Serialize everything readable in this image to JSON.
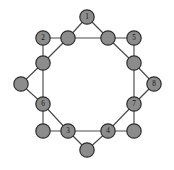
{
  "figure": {
    "name": "node-link-graph",
    "background_color": "#ffffff"
  },
  "style": {
    "node_fill": "#8c8c8c",
    "node_stroke": "#2e2e2e",
    "edge_color": "#4a4a4a",
    "label_color": "#141414",
    "node_radius": 7.2,
    "edge_width": 1.15
  },
  "chart_data": {
    "type": "diagram",
    "title": "",
    "layout": "star-of-eight-points over inner octagon",
    "node_count": 16,
    "edge_count": 24,
    "nodes": [
      {
        "id": "outer-n",
        "label": "1",
        "x": 87,
        "y": 17,
        "ring": "outer",
        "label_visible": true
      },
      {
        "id": "outer-nw",
        "label": "2",
        "x": 43,
        "y": 38,
        "ring": "outer",
        "label_visible": true
      },
      {
        "id": "outer-ne",
        "label": "5",
        "x": 134,
        "y": 38,
        "ring": "outer",
        "label_visible": true
      },
      {
        "id": "outer-w",
        "label": "",
        "x": 21,
        "y": 84,
        "ring": "outer",
        "label_visible": false
      },
      {
        "id": "outer-e",
        "label": "8",
        "x": 154,
        "y": 84,
        "ring": "outer",
        "label_visible": true
      },
      {
        "id": "outer-sw",
        "label": "",
        "x": 43,
        "y": 131,
        "ring": "outer",
        "label_visible": false
      },
      {
        "id": "outer-se",
        "label": "",
        "x": 134,
        "y": 131,
        "ring": "outer",
        "label_visible": false
      },
      {
        "id": "outer-s",
        "label": "",
        "x": 87,
        "y": 150,
        "ring": "outer",
        "label_visible": false
      },
      {
        "id": "inner-nnw",
        "label": "",
        "x": 68,
        "y": 38,
        "ring": "inner",
        "label_visible": false
      },
      {
        "id": "inner-nne",
        "label": "",
        "x": 108,
        "y": 38,
        "ring": "inner",
        "label_visible": false
      },
      {
        "id": "inner-wnw",
        "label": "",
        "x": 43,
        "y": 63,
        "ring": "inner",
        "label_visible": false
      },
      {
        "id": "inner-ene",
        "label": "",
        "x": 134,
        "y": 63,
        "ring": "inner",
        "label_visible": false
      },
      {
        "id": "inner-wsw",
        "label": "6",
        "x": 43,
        "y": 104,
        "ring": "inner",
        "label_visible": true
      },
      {
        "id": "inner-ese",
        "label": "7",
        "x": 134,
        "y": 104,
        "ring": "inner",
        "label_visible": true
      },
      {
        "id": "inner-ssw",
        "label": "3",
        "x": 68,
        "y": 131,
        "ring": "inner",
        "label_visible": true
      },
      {
        "id": "inner-sse",
        "label": "4",
        "x": 108,
        "y": 131,
        "ring": "inner",
        "label_visible": true
      }
    ],
    "edges": [
      {
        "from": "outer-n",
        "to": "inner-nnw"
      },
      {
        "from": "outer-n",
        "to": "inner-nne"
      },
      {
        "from": "outer-nw",
        "to": "inner-nnw"
      },
      {
        "from": "outer-nw",
        "to": "inner-wnw"
      },
      {
        "from": "outer-ne",
        "to": "inner-nne"
      },
      {
        "from": "outer-ne",
        "to": "inner-ene"
      },
      {
        "from": "outer-w",
        "to": "inner-wnw"
      },
      {
        "from": "outer-w",
        "to": "inner-wsw"
      },
      {
        "from": "outer-e",
        "to": "inner-ene"
      },
      {
        "from": "outer-e",
        "to": "inner-ese"
      },
      {
        "from": "outer-sw",
        "to": "inner-wsw"
      },
      {
        "from": "outer-sw",
        "to": "inner-ssw"
      },
      {
        "from": "outer-se",
        "to": "inner-ese"
      },
      {
        "from": "outer-se",
        "to": "inner-sse"
      },
      {
        "from": "outer-s",
        "to": "inner-ssw"
      },
      {
        "from": "outer-s",
        "to": "inner-sse"
      },
      {
        "from": "inner-nnw",
        "to": "inner-nne"
      },
      {
        "from": "inner-nnw",
        "to": "inner-wnw"
      },
      {
        "from": "inner-nne",
        "to": "inner-ene"
      },
      {
        "from": "inner-wnw",
        "to": "inner-wsw"
      },
      {
        "from": "inner-ene",
        "to": "inner-ese"
      },
      {
        "from": "inner-wsw",
        "to": "inner-ssw"
      },
      {
        "from": "inner-ese",
        "to": "inner-sse"
      },
      {
        "from": "inner-ssw",
        "to": "inner-sse"
      }
    ]
  }
}
